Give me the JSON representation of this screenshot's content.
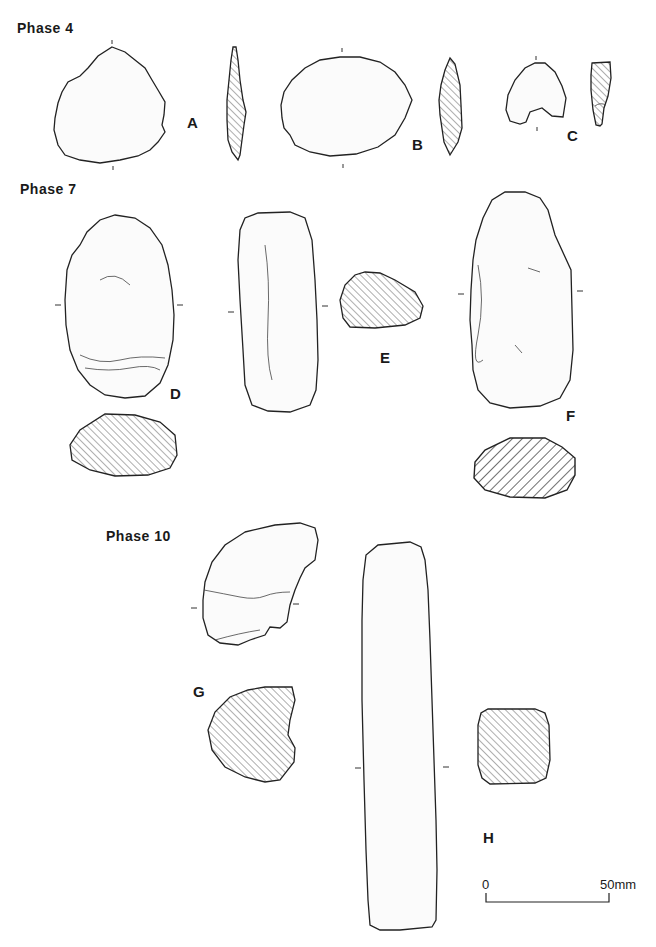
{
  "figure": {
    "phases": [
      {
        "label": "Phase 4",
        "items": [
          "A",
          "B",
          "C"
        ]
      },
      {
        "label": "Phase 7",
        "items": [
          "D",
          "E",
          "F"
        ]
      },
      {
        "label": "Phase 10",
        "items": [
          "G",
          "H"
        ]
      }
    ],
    "item_labels": {
      "A": "A",
      "B": "B",
      "C": "C",
      "D": "D",
      "E": "E",
      "F": "F",
      "G": "G",
      "H": "H"
    },
    "scale_bar": {
      "start": "0",
      "end": "50mm"
    },
    "colors": {
      "ink": "#222222",
      "paper": "#ffffff",
      "stipple": "#bbbbbb"
    }
  }
}
